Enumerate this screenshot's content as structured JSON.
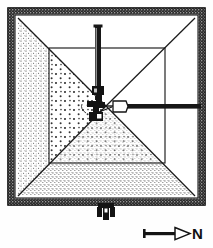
{
  "figure": {
    "type": "archaeological-plan"
  },
  "compass": {
    "label": "N",
    "arrow_direction": "right",
    "name": "north-arrow"
  },
  "colors": {
    "ink": "#141414",
    "paper": "#fefefe",
    "wall_band": "#2a2a2a",
    "line": "#1b1b1b",
    "stipple": "#3a3a3a"
  },
  "structure": {
    "outer_wall": {
      "label": "outer enclosure wall",
      "x": 11,
      "y": 11,
      "w": 191,
      "h": 191,
      "band": 7
    },
    "inner_rect": {
      "label": "inner chamber rectangle",
      "x": 49,
      "y": 48,
      "w": 116,
      "h": 115
    },
    "diagonals": [
      {
        "label": "diagonal-nw",
        "x1": 18,
        "y1": 18,
        "x2": 106,
        "y2": 106
      },
      {
        "label": "diagonal-ne",
        "x1": 195,
        "y1": 18,
        "x2": 106,
        "y2": 106
      },
      {
        "label": "diagonal-sw",
        "x1": 18,
        "y1": 196,
        "x2": 106,
        "y2": 106
      },
      {
        "label": "diagonal-se",
        "x1": 195,
        "y1": 196,
        "x2": 106,
        "y2": 106
      }
    ],
    "north_shaft": {
      "label": "north vertical shaft",
      "x": 95,
      "y": 26,
      "w": 6,
      "h": 72
    },
    "east_corridor": {
      "label": "east horizontal corridor",
      "x": 116,
      "y": 104,
      "w": 85,
      "h": 5
    },
    "center_chamber": {
      "label": "central burial chamber",
      "cx": 104,
      "cy": 106
    },
    "south_entrance": {
      "label": "south entrance structure",
      "x": 97,
      "y": 202,
      "w": 17,
      "h": 17
    }
  }
}
